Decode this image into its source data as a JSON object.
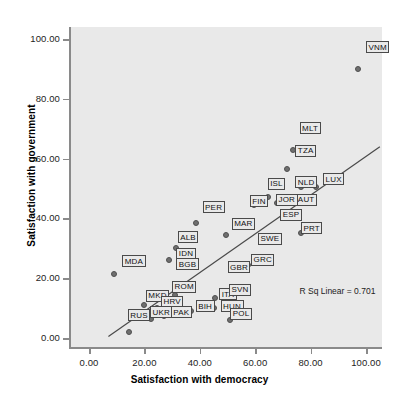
{
  "chart_data": {
    "type": "scatter",
    "title": "",
    "xlabel": "Satisfaction with democracy",
    "ylabel": "Satisfaction with government",
    "xlim": [
      -7,
      107
    ],
    "ylim": [
      -4,
      104
    ],
    "xticks": [
      "0.00",
      "20.00",
      "40.00",
      "60.00",
      "80.00",
      "100.00"
    ],
    "yticks": [
      "0.00",
      "20.00",
      "40.00",
      "60.00",
      "80.00",
      "100.00"
    ],
    "xtick_values": [
      0,
      20,
      40,
      60,
      80,
      100
    ],
    "ytick_values": [
      0,
      20,
      40,
      60,
      80,
      100
    ],
    "grid": false,
    "legend": "none",
    "annotation": "R Sq Linear = 0.701",
    "fit_line": {
      "x0": 7,
      "y0": 0.5,
      "x1": 105,
      "y1": 64
    },
    "point_label_field": "country",
    "points": [
      {
        "country": "VNM",
        "x": 97.0,
        "y": 90.0,
        "lx": 100.0,
        "ly": 97.5
      },
      {
        "country": "MLT",
        "x": 73.5,
        "y": 63.0,
        "lx": 76.0,
        "ly": 70.5
      },
      {
        "country": "TZA",
        "x": 71.5,
        "y": 56.5,
        "lx": 74.5,
        "ly": 63.0
      },
      {
        "country": "LUX",
        "x": 82.0,
        "y": 50.5,
        "lx": 84.5,
        "ly": 53.5
      },
      {
        "country": "NLD",
        "x": 76.5,
        "y": 50.5,
        "lx": 74.5,
        "ly": 52.5
      },
      {
        "country": "ISL",
        "x": 64.5,
        "y": 47.0,
        "lx": 64.5,
        "ly": 52.0
      },
      {
        "country": "AUT",
        "x": 75.0,
        "y": 46.0,
        "lx": 74.5,
        "ly": 46.5
      },
      {
        "country": "JOR",
        "x": 68.0,
        "y": 45.0,
        "lx": 67.5,
        "ly": 46.5
      },
      {
        "country": "FIN",
        "x": 59.5,
        "y": 44.5,
        "lx": 58.0,
        "ly": 46.0
      },
      {
        "country": "ESP",
        "x": 70.5,
        "y": 40.5,
        "lx": 69.0,
        "ly": 41.5
      },
      {
        "country": "PRT",
        "x": 76.5,
        "y": 35.0,
        "lx": 76.5,
        "ly": 37.0
      },
      {
        "country": "PER",
        "x": 38.5,
        "y": 38.5,
        "lx": 41.0,
        "ly": 44.0
      },
      {
        "country": "MAR",
        "x": 49.5,
        "y": 34.5,
        "lx": 51.5,
        "ly": 38.5
      },
      {
        "country": "SWE",
        "x": 62.5,
        "y": 32.0,
        "lx": 61.0,
        "ly": 33.5
      },
      {
        "country": "GRC",
        "x": 57.5,
        "y": 24.5,
        "lx": 58.5,
        "ly": 26.5
      },
      {
        "country": "GBR",
        "x": 52.0,
        "y": 23.5,
        "lx": 50.0,
        "ly": 24.0
      },
      {
        "country": "ALB",
        "x": 31.5,
        "y": 30.0,
        "lx": 32.0,
        "ly": 34.0
      },
      {
        "country": "IDN",
        "x": 29.0,
        "y": 26.0,
        "lx": 31.5,
        "ly": 28.5
      },
      {
        "country": "BGB",
        "x": 33.5,
        "y": 24.5,
        "lx": 31.5,
        "ly": 25.0
      },
      {
        "country": "MDA",
        "x": 9.0,
        "y": 21.5,
        "lx": 12.0,
        "ly": 26.0
      },
      {
        "country": "ROM",
        "x": 31.0,
        "y": 14.5,
        "lx": 30.0,
        "ly": 17.5
      },
      {
        "country": "ITA",
        "x": 45.5,
        "y": 13.5,
        "lx": 47.0,
        "ly": 15.0
      },
      {
        "country": "SVN",
        "x": 51.5,
        "y": 11.5,
        "lx": 50.5,
        "ly": 16.5
      },
      {
        "country": "HUN",
        "x": 45.0,
        "y": 10.0,
        "lx": 47.5,
        "ly": 11.0
      },
      {
        "country": "MKD",
        "x": 20.0,
        "y": 11.0,
        "lx": 20.5,
        "ly": 14.5
      },
      {
        "country": "HRV",
        "x": 24.5,
        "y": 10.0,
        "lx": 26.0,
        "ly": 12.5
      },
      {
        "country": "BIH",
        "x": 37.0,
        "y": 9.0,
        "lx": 38.5,
        "ly": 11.0
      },
      {
        "country": "PAK",
        "x": 27.0,
        "y": 7.5,
        "lx": 29.5,
        "ly": 9.0
      },
      {
        "country": "UKR",
        "x": 22.5,
        "y": 6.5,
        "lx": 22.0,
        "ly": 9.0
      },
      {
        "country": "POL",
        "x": 51.0,
        "y": 6.0,
        "lx": 51.0,
        "ly": 8.5
      },
      {
        "country": "RUS",
        "x": 14.5,
        "y": 2.0,
        "lx": 14.0,
        "ly": 8.0
      }
    ]
  }
}
